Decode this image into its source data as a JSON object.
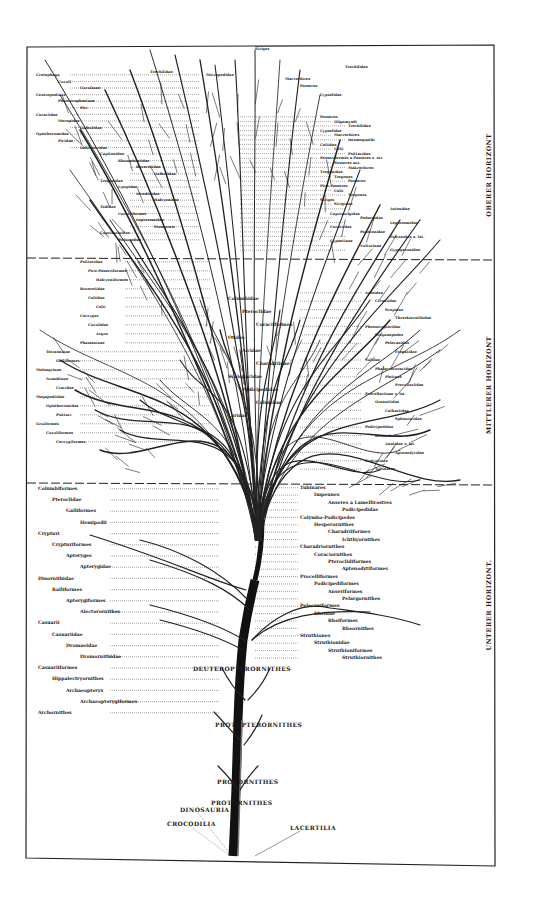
{
  "figure": {
    "type": "phylogenetic tree (Stammbaum der Vögel)",
    "horizons": [
      {
        "id": "upper",
        "label": "OBERER HORIZONT"
      },
      {
        "id": "middle",
        "label": "MITTLERER HORIZONT"
      },
      {
        "id": "lower",
        "label": "UNTERER HORIZONT."
      }
    ],
    "root_labels": {
      "dinosauria": "DINOSAURIA",
      "crocodilia": "CROCODILIA",
      "lacertilia": "LACERTILIA"
    },
    "stem_labels": {
      "protornithes_1": "PROTORNITHES",
      "protornithes_2": "PROTORNITHES",
      "protopterornithes": "PROTOPTERORNITHES",
      "deuteropterornithes": "DEUTEROPTERORNITHES"
    },
    "upper_labels": {
      "left": [
        "Crotophaga",
        "Cuculi",
        "Cuculinae",
        "Centropodinae",
        "Phoenicophaeinae",
        "Pici",
        "Coraciidae",
        "Meropidae",
        "Galbulidae",
        "Opisthocomidae",
        "Picidae",
        "Indicatoridae",
        "Capitonidae",
        "Rhamphastidae",
        "Bucerotidae",
        "Galbulidae",
        "Trogonidae",
        "Upupidae",
        "Alcedinidae",
        "Halcyonidae",
        "Todidae",
        "Coraciiformes",
        "Leptosomidae",
        "Steatornis",
        "Caprimulgidae",
        "Podargidae"
      ],
      "top": [
        "Trochilidae",
        "Micropodidae",
        "Striges",
        "Macrochires",
        "Passeres",
        "Cypselidae",
        "Trochilidae"
      ],
      "right": [
        "Passeres",
        "Oligomyodi",
        "Trochilidae",
        "Cypselidae",
        "Macrochires",
        "Desmognathi",
        "Coliidae",
        "Colii",
        "Psittacidae",
        "Passeriformes a Passeres s. str.",
        "Passeres aut.",
        "Makrochires",
        "Trogonidae",
        "Trogones",
        "Passeres",
        "Pico-Passeres",
        "Colii",
        "Trogones",
        "Striges",
        "Strigidae",
        "Asionidae",
        "Caprimulgidae",
        "Podargidae",
        "Leptosomidae",
        "Coraciidae",
        "Pandionidae",
        "Falconidae a. lat.",
        "Gypaetinae",
        "Vulturinae",
        "Gypogeranidae"
      ]
    },
    "middle_labels": {
      "left": [
        "Psittacidae",
        "Pico-Passeriformes",
        "Halcyoniformes",
        "Bucerotidae",
        "Coliidae",
        "Colii",
        "Coccyges",
        "Cuculidae",
        "Argus",
        "Phasianinae",
        "Tetraoninae",
        "Galliformes",
        "Meleagrinae",
        "Numidinae",
        "Cracidae",
        "Megapodiidae",
        "Opisthocomidae",
        "Psittaci",
        "Gruiformes",
        "Cuculiformes",
        "Coccygiformes"
      ],
      "center": [
        "Columbidae",
        "Pteroclidae",
        "Coraciiformes",
        "Otides",
        "Alcidae",
        "Charadriidae",
        "Scolopacidae",
        "Podicipedidae",
        "Columbae",
        "Laridae"
      ],
      "right": [
        "Ardeidae",
        "Ciconiidae",
        "Scopidae",
        "Threskiornithidae",
        "Phoenicopteridae",
        "Steganopodes",
        "Pelecanidae",
        "Fregatidae",
        "Sulidae",
        "Phalacrocoracidae",
        "Plotinae",
        "Procellariidae",
        "Procellariinae s. lat.",
        "Oceanitidae",
        "Cathartidae",
        "Spheniscidae",
        "Podicipedidae",
        "Diomedeidae",
        "Anatidae s. lat.",
        "Aptenodytidae",
        "Eudyptinae",
        "Tubinares"
      ]
    },
    "lower_labels": {
      "left": [
        "Columbiformes",
        "Pteroclidae",
        "Galliformes",
        "Hemipodii",
        "Crypturi",
        "Crypturiformes",
        "Apteryges",
        "Apterygidae",
        "Dinornithidae",
        "Ralliformes",
        "Apterygiformes",
        "Alectorornithes",
        "Casuarii",
        "Casuariidae",
        "Dromaeidae",
        "Dromornithidae",
        "Casuariiformes",
        "Hippalectryornithes",
        "Archaeopteryx",
        "Archaeopterygiformes",
        "Archornithes"
      ],
      "right": [
        "Tubinares",
        "Impennes",
        "Anseres a Lamellirostres",
        "Podicipedidae",
        "Colymbo-Podicipedes",
        "Hesperornithes",
        "Charadriiformes",
        "Ichthyornithes",
        "Charadriornithes",
        "Coraciornithes",
        "Pteroclidiformes",
        "Aptenodytiformes",
        "Procelliformes",
        "Podicipediformes",
        "Anseriformes",
        "Pelargornithes",
        "Pelecaniformes",
        "Rheidae",
        "Rheiformes",
        "Rheornithes",
        "Struthiones",
        "Struthionidae",
        "Struthioniformes",
        "Struthiornithes"
      ]
    }
  }
}
